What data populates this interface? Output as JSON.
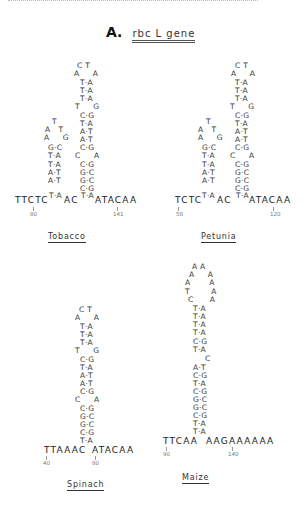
{
  "figure": {
    "label": "A.",
    "gene": "rbc L gene"
  },
  "panels": {
    "tobacco": {
      "species": "Tobacco",
      "small_loop": [
        "T",
        "A   T",
        "A     G"
      ],
      "small_stem": [
        "G·C",
        "T·A",
        "T·A",
        "A·T",
        "A·T",
        "T·A"
      ],
      "big_loop": [
        "C T",
        "A     A"
      ],
      "big_stem_upper": [
        "T·A",
        "T·A",
        "T·A"
      ],
      "big_bulge_1": "T     G",
      "big_stem_mid": [
        "C·G",
        "T·A",
        "A·T",
        "A·T",
        "C·G"
      ],
      "big_bulge_2": "C     A",
      "big_stem_lower": [
        "C·G",
        "G·C",
        "G·C",
        "C·G",
        "T·A"
      ],
      "left_seq": "TTCTC",
      "bottom_left_pair": "T·A",
      "between": "AC",
      "bottom_right_pair": "T·A",
      "right_seq": "ATACAA",
      "num_left": "80",
      "num_right": "141"
    },
    "petunia": {
      "species": "Petunia",
      "small_loop": [
        "T",
        "A   T",
        "A     G"
      ],
      "small_stem": [
        "G·C",
        "T·A",
        "T·A",
        "A·T",
        "A·T",
        "T·A"
      ],
      "big_loop": [
        "C T",
        "A     A"
      ],
      "big_stem_upper": [
        "T·A",
        "T·A",
        "T·A"
      ],
      "big_bulge_1": "T     G",
      "big_stem_mid": [
        "C·G",
        "T·A",
        "A·T",
        "A·T",
        "C·G"
      ],
      "big_bulge_2": "C     A",
      "big_stem_lower": [
        "C·G",
        "G·C",
        "G·C",
        "C·G",
        "T·A"
      ],
      "left_seq": "TCTC",
      "bottom_left_pair": "T·A",
      "between": "AC",
      "bottom_right_pair": "T·A",
      "right_seq": "ATACAA",
      "num_left": "58",
      "num_right": "120"
    },
    "spinach": {
      "species": "Spinach",
      "loop": [
        "C T",
        "A     A"
      ],
      "stem_upper": [
        "T·A",
        "T·A",
        "T·A"
      ],
      "bulge_1": "T     G",
      "stem_mid": [
        "C·G",
        "T·A",
        "A·T",
        "A·T",
        "C·G"
      ],
      "bulge_2": "C     A",
      "stem_lower": [
        "C·G",
        "G·C",
        "G·C",
        "C·G",
        "T·A"
      ],
      "left_seq": "TTAAAC",
      "right_seq": "ATACAA",
      "num_left": "40",
      "num_right": "80"
    },
    "maize": {
      "species": "Maize",
      "loop": [
        "A A",
        "A     A",
        "A       A",
        "T        A",
        "C      A"
      ],
      "stem_upper": [
        "T·A",
        "T·A",
        "T·A",
        "T·A",
        "C·G",
        "T·A"
      ],
      "bulge": "C",
      "stem_lower": [
        "A·T",
        "C·G",
        "T·A",
        "C·G",
        "G·C",
        "G·C",
        "C·G",
        "T·A",
        "T·A"
      ],
      "left_seq": "TTCAA",
      "right_seq": "AAGAAAAAA",
      "num_left": "90",
      "num_right": "140"
    }
  }
}
